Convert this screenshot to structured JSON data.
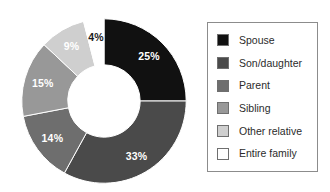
{
  "chart_data": {
    "type": "pie",
    "variant": "donut",
    "title": "",
    "subtitle": "",
    "xlabel": "",
    "ylabel": "",
    "grid": false,
    "legend_position": "right",
    "start_angle_deg": 0,
    "direction": "clockwise",
    "inner_radius_ratio": 0.44,
    "value_unit": "%",
    "categories": [
      "Spouse",
      "Son/daughter",
      "Parent",
      "Sibling",
      "Other relative",
      "Entire family"
    ],
    "values": [
      25,
      33,
      14,
      15,
      9,
      4
    ],
    "data_labels": [
      "25%",
      "33%",
      "14%",
      "15%",
      "9%",
      "4%"
    ],
    "colors": [
      "#111111",
      "#4a4a4a",
      "#6e6e6e",
      "#989898",
      "#cfcfcf",
      "#ffffff"
    ],
    "label_colors": [
      "#ffffff",
      "#ffffff",
      "#ffffff",
      "#ffffff",
      "#ffffff",
      "#1a1a1a"
    ],
    "slices": [
      {
        "name": "Spouse",
        "value": 25,
        "label": "25%",
        "color": "#111111",
        "label_color": "#ffffff"
      },
      {
        "name": "Son/daughter",
        "value": 33,
        "label": "33%",
        "color": "#4a4a4a",
        "label_color": "#ffffff"
      },
      {
        "name": "Parent",
        "value": 14,
        "label": "14%",
        "color": "#6e6e6e",
        "label_color": "#ffffff"
      },
      {
        "name": "Sibling",
        "value": 15,
        "label": "15%",
        "color": "#989898",
        "label_color": "#ffffff"
      },
      {
        "name": "Other relative",
        "value": 9,
        "label": "9%",
        "color": "#cfcfcf",
        "label_color": "#ffffff"
      },
      {
        "name": "Entire family",
        "value": 4,
        "label": "4%",
        "color": "#ffffff",
        "label_color": "#1a1a1a"
      }
    ]
  },
  "legend": {
    "border_color": "#8c8c8c",
    "items": [
      {
        "label": "Spouse",
        "color": "#111111"
      },
      {
        "label": "Son/daughter",
        "color": "#4a4a4a"
      },
      {
        "label": "Parent",
        "color": "#6e6e6e"
      },
      {
        "label": "Sibling",
        "color": "#989898"
      },
      {
        "label": "Other relative",
        "color": "#cfcfcf"
      },
      {
        "label": "Entire family",
        "color": "#ffffff"
      }
    ]
  }
}
